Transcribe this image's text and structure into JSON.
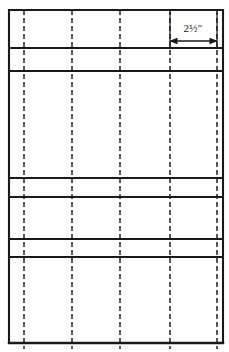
{
  "diagram": {
    "kind": "technical-line-drawing",
    "canvas": {
      "width": 229,
      "height": 352
    },
    "colors": {
      "background": "#ffffff",
      "solid_line": "#1a1a1a",
      "dashed_line": "#3a3a3a",
      "dimension_line": "#1a1a1a",
      "text": "#1a1a1a"
    },
    "frame": {
      "label": "outer-frame",
      "left": 9,
      "right": 223,
      "top": 10,
      "bottom": 343,
      "stroke_width": 2.1
    },
    "horizontal_rails": [
      {
        "name": "rail-top-plate",
        "y": 10,
        "stroke_width": 2.1,
        "x1": 9,
        "x2": 223
      },
      {
        "name": "rail-1",
        "y": 48,
        "stroke_width": 1.9,
        "x1": 9,
        "x2": 223
      },
      {
        "name": "rail-2",
        "y": 71,
        "stroke_width": 1.9,
        "x1": 9,
        "x2": 223
      },
      {
        "name": "rail-3",
        "y": 178,
        "stroke_width": 1.9,
        "x1": 9,
        "x2": 223
      },
      {
        "name": "rail-4",
        "y": 197,
        "stroke_width": 1.9,
        "x1": 9,
        "x2": 223
      },
      {
        "name": "rail-5",
        "y": 239,
        "stroke_width": 1.9,
        "x1": 9,
        "x2": 223
      },
      {
        "name": "rail-6",
        "y": 257,
        "stroke_width": 1.9,
        "x1": 9,
        "x2": 223
      },
      {
        "name": "rail-bottom-plate",
        "y": 343,
        "stroke_width": 2.4,
        "x1": 9,
        "x2": 223
      }
    ],
    "vertical_studs": [
      {
        "name": "stud-1",
        "x": 24,
        "y1": 10,
        "y2": 349,
        "stroke_width": 1.7
      },
      {
        "name": "stud-2",
        "x": 72,
        "y1": 10,
        "y2": 349,
        "stroke_width": 1.7
      },
      {
        "name": "stud-3",
        "x": 120,
        "y1": 10,
        "y2": 349,
        "stroke_width": 1.7
      },
      {
        "name": "stud-4",
        "x": 170,
        "y1": 10,
        "y2": 349,
        "stroke_width": 1.7
      },
      {
        "name": "stud-5",
        "x": 217,
        "y1": 10,
        "y2": 349,
        "stroke_width": 1.7
      }
    ],
    "dash_pattern": "5 3",
    "dimension": {
      "name": "stud-spacing-dimension",
      "label": "2½″",
      "value": 2.5,
      "unit": "inch",
      "from_x": 170,
      "to_x": 217,
      "line_y": 41,
      "label_x": 193,
      "label_y": 32,
      "arrowhead": "both",
      "witness_lines": [
        {
          "x": 170,
          "y1": 12,
          "y2": 48
        },
        {
          "x": 217,
          "y1": 12,
          "y2": 48
        }
      ]
    },
    "bands": [
      {
        "name": "band-top-open",
        "top": 10,
        "bottom": 48
      },
      {
        "name": "band-narrow-1",
        "top": 48,
        "bottom": 71
      },
      {
        "name": "band-tall-middle",
        "top": 71,
        "bottom": 178
      },
      {
        "name": "band-narrow-2",
        "top": 178,
        "bottom": 197
      },
      {
        "name": "band-medium",
        "top": 197,
        "bottom": 239
      },
      {
        "name": "band-narrow-3",
        "top": 239,
        "bottom": 257
      },
      {
        "name": "band-bottom-open",
        "top": 257,
        "bottom": 343
      }
    ]
  }
}
